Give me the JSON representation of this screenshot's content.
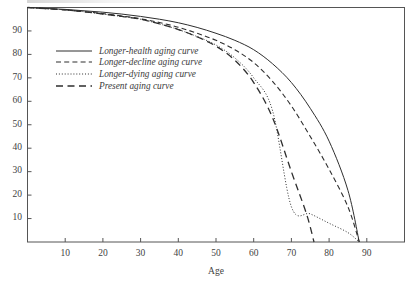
{
  "chart_data": {
    "type": "line",
    "title": "",
    "xlabel": "Age",
    "ylabel": "",
    "xlim": [
      0,
      100
    ],
    "ylim": [
      0,
      100
    ],
    "xticks": [
      10,
      20,
      30,
      40,
      50,
      60,
      70,
      80,
      90
    ],
    "yticks": [
      10,
      20,
      30,
      40,
      50,
      60,
      70,
      80,
      90
    ],
    "xtick_labels": [
      "10",
      "20",
      "30",
      "40",
      "50",
      "60",
      "70",
      "80",
      "90"
    ],
    "ytick_labels": [
      "10",
      "20",
      "30",
      "40",
      "50",
      "60",
      "70",
      "80",
      "90"
    ],
    "grid": false,
    "legend_position": "upper-left",
    "series": [
      {
        "name": "Longer-health aging curve",
        "style": "solid",
        "color": "#2e2e2e",
        "x": [
          0,
          5,
          10,
          15,
          20,
          25,
          30,
          35,
          40,
          45,
          50,
          55,
          60,
          65,
          70,
          75,
          80,
          85,
          88
        ],
        "y": [
          100,
          99.6,
          99.2,
          98.6,
          98,
          97.2,
          96.2,
          95,
          93.5,
          91.5,
          89,
          86,
          82,
          76,
          68,
          57,
          43,
          22,
          0
        ]
      },
      {
        "name": "Longer-decline aging curve",
        "style": "dashed",
        "color": "#2e2e2e",
        "x": [
          0,
          5,
          10,
          15,
          20,
          25,
          30,
          35,
          40,
          45,
          50,
          55,
          60,
          65,
          70,
          75,
          80,
          85,
          88
        ],
        "y": [
          100,
          99.5,
          99,
          98.2,
          97.4,
          96.4,
          95.2,
          93.6,
          91.6,
          89,
          86,
          82,
          76.5,
          68.5,
          58,
          45,
          31,
          15,
          0
        ]
      },
      {
        "name": "Longer-dying aging curve",
        "style": "dotted",
        "color": "#2e2e2e",
        "x": [
          0,
          5,
          10,
          15,
          20,
          25,
          30,
          35,
          40,
          45,
          50,
          55,
          60,
          65,
          70,
          75,
          80,
          85,
          88
        ],
        "y": [
          100,
          99.5,
          99,
          98.2,
          97.2,
          96.2,
          95,
          93,
          90.6,
          87.6,
          84,
          78.5,
          70,
          56,
          15,
          12,
          8,
          4,
          0
        ]
      },
      {
        "name": "Present aging curve",
        "style": "longdash",
        "color": "#2e2e2e",
        "x": [
          0,
          5,
          10,
          15,
          20,
          25,
          30,
          35,
          40,
          45,
          50,
          55,
          60,
          65,
          70,
          74,
          76
        ],
        "y": [
          100,
          99.5,
          99,
          98.2,
          97.2,
          96.2,
          95,
          93,
          90.6,
          87.5,
          83.5,
          77.5,
          68,
          53,
          30,
          12,
          0
        ]
      }
    ]
  },
  "legend": {
    "items": [
      {
        "label": "Longer-health aging curve",
        "style": "solid"
      },
      {
        "label": "Longer-decline aging curve",
        "style": "dashed"
      },
      {
        "label": "Longer-dying aging curve",
        "style": "dotted"
      },
      {
        "label": "Present aging curve",
        "style": "longdash"
      }
    ]
  }
}
